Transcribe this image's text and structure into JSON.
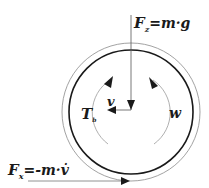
{
  "diagram": {
    "type": "free-body-diagram",
    "labels": {
      "fz_main": "F",
      "fz_sub": "z",
      "fz_rhs": "=m·g",
      "fx_main": "F",
      "fx_sub": "x",
      "fx_rhs": "=-m·v̇",
      "v": "v",
      "tb_main": "T",
      "tb_sub": "b",
      "w": "w"
    },
    "forces": [
      {
        "name": "F_z",
        "expression": "F_z = m·g",
        "direction": "down"
      },
      {
        "name": "F_x",
        "expression": "F_x = -m·v̇",
        "direction": "right"
      }
    ],
    "motion": [
      {
        "name": "v",
        "meaning": "velocity",
        "direction": "left"
      },
      {
        "name": "w",
        "meaning": "angular velocity",
        "direction": "counter-clockwise arc (right side)"
      },
      {
        "name": "T_b",
        "meaning": "brake torque",
        "direction": "arc (left side)"
      }
    ],
    "colors": {
      "stroke": "#1a1a1a",
      "thin_stroke": "#7a7a7a",
      "background": "#ffffff"
    }
  }
}
